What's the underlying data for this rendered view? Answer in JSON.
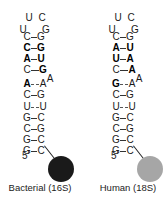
{
  "panels": [
    {
      "label": "Bacterial (16S)",
      "ball_color": "#1a1a1a",
      "loop": {
        "top_left": "U",
        "top_right": "C",
        "mid_left": "U",
        "mid_right": "G"
      },
      "bulge": "A",
      "prime": "5'",
      "pairs": [
        {
          "left": "C",
          "right": "G",
          "left_bold": false,
          "right_bold": false,
          "bond": "solid"
        },
        {
          "left": "C",
          "right": "G",
          "left_bold": true,
          "right_bold": true,
          "bond": "solid"
        },
        {
          "left": "A",
          "right": "U",
          "left_bold": true,
          "right_bold": true,
          "bond": "solid"
        },
        {
          "left": "C",
          "right": "G",
          "left_bold": false,
          "right_bold": true,
          "bond": "solid"
        },
        {
          "left": "A",
          "right": "A",
          "left_bold": true,
          "right_bold": false,
          "bond": "weak"
        },
        {
          "left": "C",
          "right": "G",
          "left_bold": false,
          "right_bold": false,
          "bond": "solid"
        },
        {
          "left": "U",
          "right": "U",
          "left_bold": false,
          "right_bold": false,
          "bond": "weak"
        },
        {
          "left": "G",
          "right": "C",
          "left_bold": false,
          "right_bold": false,
          "bond": "solid"
        },
        {
          "left": "C",
          "right": "G",
          "left_bold": false,
          "right_bold": false,
          "bond": "solid"
        },
        {
          "left": "G",
          "right": "C",
          "left_bold": false,
          "right_bold": false,
          "bond": "solid"
        },
        {
          "left": "G",
          "right": "C",
          "left_bold": false,
          "right_bold": false,
          "bond": "solid"
        }
      ]
    },
    {
      "label": "Human (18S)",
      "ball_color": "#a6a6a6",
      "loop": {
        "top_left": "U",
        "top_right": "C",
        "mid_left": "U",
        "mid_right": "G"
      },
      "bulge": "A",
      "prime": "5'",
      "pairs": [
        {
          "left": "C",
          "right": "G",
          "left_bold": false,
          "right_bold": false,
          "bond": "solid"
        },
        {
          "left": "A",
          "right": "U",
          "left_bold": true,
          "right_bold": true,
          "bond": "solid"
        },
        {
          "left": "U",
          "right": "A",
          "left_bold": true,
          "right_bold": true,
          "bond": "solid"
        },
        {
          "left": "C",
          "right": "A",
          "left_bold": false,
          "right_bold": true,
          "bond": "solid"
        },
        {
          "left": "G",
          "right": "A",
          "left_bold": true,
          "right_bold": false,
          "bond": "weak"
        },
        {
          "left": "C",
          "right": "G",
          "left_bold": false,
          "right_bold": false,
          "bond": "solid"
        },
        {
          "left": "U",
          "right": "U",
          "left_bold": false,
          "right_bold": false,
          "bond": "weak"
        },
        {
          "left": "G",
          "right": "C",
          "left_bold": false,
          "right_bold": false,
          "bond": "solid"
        },
        {
          "left": "C",
          "right": "G",
          "left_bold": false,
          "right_bold": false,
          "bond": "solid"
        },
        {
          "left": "G",
          "right": "C",
          "left_bold": false,
          "right_bold": false,
          "bond": "solid"
        },
        {
          "left": "G",
          "right": "C",
          "left_bold": false,
          "right_bold": false,
          "bond": "solid"
        }
      ]
    }
  ]
}
